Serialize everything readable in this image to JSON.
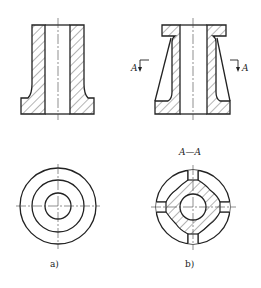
{
  "figure": {
    "views": [
      {
        "id": "a",
        "caption": "a)"
      },
      {
        "id": "b",
        "caption": "b)",
        "section_title": "A—A",
        "section_arrow_left": "A",
        "section_arrow_right": "A"
      }
    ]
  },
  "colors": {
    "line": "#222222",
    "hatch": "#444444",
    "background": "#ffffff"
  }
}
